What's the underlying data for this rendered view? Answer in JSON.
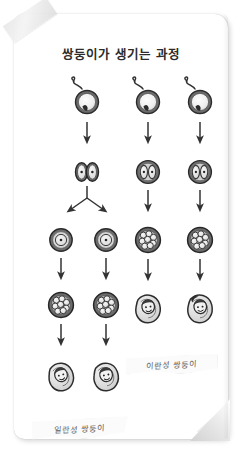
{
  "page": {
    "title": "쌍둥이가 생기는 과정",
    "background_color": "#ffffff",
    "paper_color": "#ffffff",
    "ink_color": "#3a3a3a"
  },
  "decorations": {
    "tape_top_left": "tape-strip",
    "folded_corner_bottom_right": "page-fold"
  },
  "labels": {
    "fraternal": "이란성 쌍둥이",
    "identical": "일란성 쌍둥이"
  },
  "diagram": {
    "type": "process-flow",
    "columns": [
      {
        "id": "identical",
        "label_ref": "labels.identical",
        "stages": [
          {
            "row": 1,
            "kind": "fertilized-egg",
            "count": 1,
            "note": "sperm entering single egg"
          },
          {
            "row": 2,
            "kind": "two-cell-split",
            "count": 1,
            "note": "zygote divides into two separate cells"
          },
          {
            "row": 3,
            "kind": "single-cell",
            "count": 2,
            "note": "two separated zygotes"
          },
          {
            "row": 4,
            "kind": "morula",
            "count": 2,
            "note": "two morulas"
          },
          {
            "row": 5,
            "kind": "baby",
            "count": 2,
            "note": "two swaddled identical babies"
          }
        ],
        "arrows": [
          "down",
          "split",
          "down",
          "down"
        ]
      },
      {
        "id": "fraternal-a",
        "label_ref": "labels.fraternal",
        "stages": [
          {
            "row": 1,
            "kind": "fertilized-egg",
            "count": 1,
            "note": "sperm entering egg one"
          },
          {
            "row": 2,
            "kind": "two-cell",
            "count": 1,
            "note": "two cells inside one membrane"
          },
          {
            "row": 3,
            "kind": "morula",
            "count": 1,
            "note": "morula"
          },
          {
            "row": 4,
            "kind": "baby",
            "count": 1,
            "note": "swaddled baby"
          }
        ],
        "arrows": [
          "down",
          "down",
          "down"
        ]
      },
      {
        "id": "fraternal-b",
        "label_ref": "labels.fraternal",
        "stages": [
          {
            "row": 1,
            "kind": "fertilized-egg",
            "count": 1,
            "note": "sperm entering egg two"
          },
          {
            "row": 2,
            "kind": "two-cell",
            "count": 1,
            "note": "two cells inside one membrane"
          },
          {
            "row": 3,
            "kind": "morula",
            "count": 1,
            "note": "morula"
          },
          {
            "row": 4,
            "kind": "baby",
            "count": 1,
            "note": "swaddled baby with dark hair tuft"
          }
        ],
        "arrows": [
          "down",
          "down",
          "down"
        ]
      }
    ]
  }
}
